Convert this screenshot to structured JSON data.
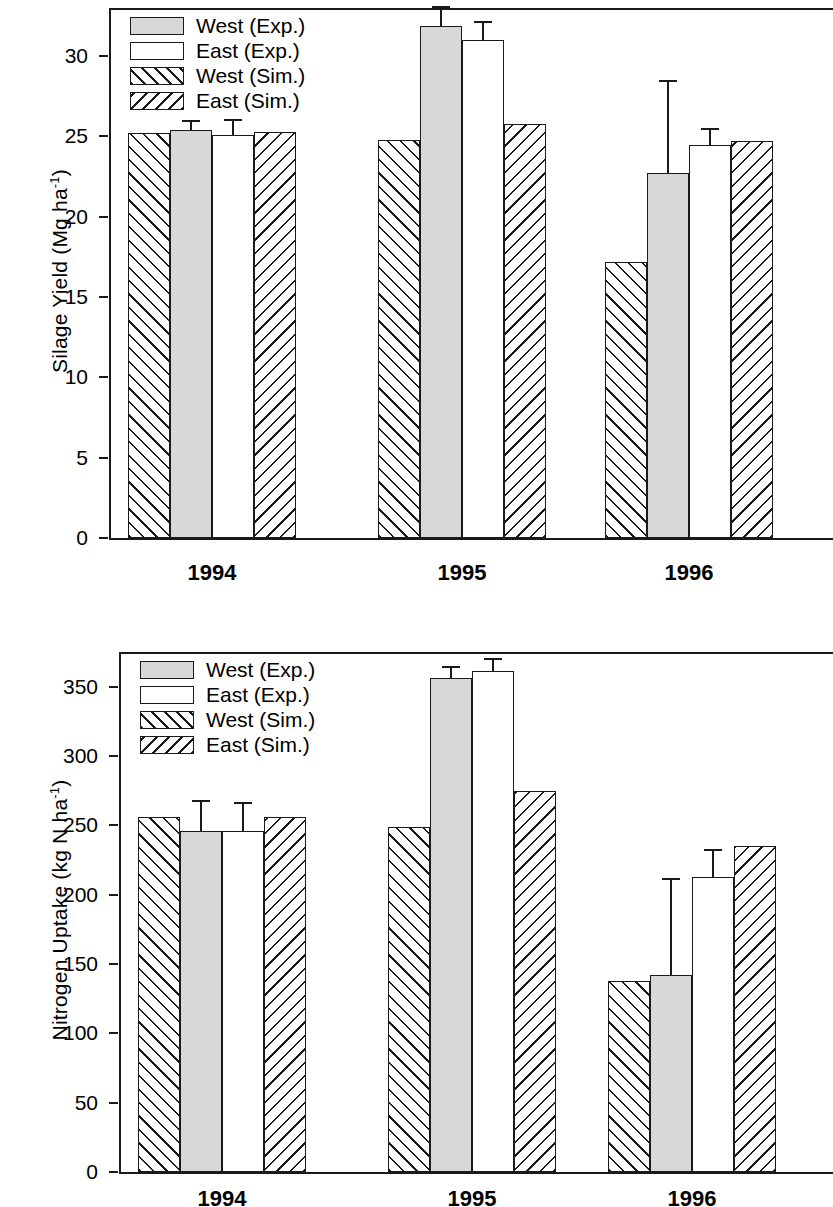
{
  "figure": {
    "legend_labels": [
      "West (Exp.)",
      "East (Exp.)",
      "West (Sim.)",
      "East (Sim.)"
    ],
    "series_keys": [
      "exp-west",
      "exp-east",
      "sim-west",
      "sim-east"
    ],
    "bar_order_in_group": [
      "West (Sim.)",
      "West (Exp.)",
      "East (Exp.)",
      "East (Sim.)"
    ],
    "colors": {
      "line": "#1a1a1a",
      "exp_west_fill": "#d8d8d8",
      "exp_east_fill": "#ffffff",
      "background": "#ffffff"
    }
  },
  "chart_data": [
    {
      "type": "bar",
      "title": "",
      "xlabel": "",
      "ylabel": "Silage Yield (Mg ha-1)",
      "ylabel_parts": {
        "text": "Silage Yield (Mg ha",
        "sup": "-1",
        "tail": ")"
      },
      "categories": [
        "1994",
        "1995",
        "1996"
      ],
      "yticks": [
        0,
        5,
        10,
        15,
        20,
        25,
        30
      ],
      "ylim": [
        0,
        33
      ],
      "grid": false,
      "legend_position": "top-left inside",
      "series": [
        {
          "name": "West (Sim.)",
          "values": [
            25.2,
            24.8,
            17.2
          ],
          "errors": [
            null,
            null,
            null
          ]
        },
        {
          "name": "West (Exp.)",
          "values": [
            25.4,
            31.9,
            22.7
          ],
          "errors": [
            0.6,
            1.2,
            5.8
          ]
        },
        {
          "name": "East (Exp.)",
          "values": [
            25.1,
            31.0,
            24.5
          ],
          "errors": [
            1.0,
            1.2,
            1.0
          ]
        },
        {
          "name": "East (Sim.)",
          "values": [
            25.3,
            25.8,
            24.7
          ],
          "errors": [
            null,
            null,
            null
          ]
        }
      ]
    },
    {
      "type": "bar",
      "title": "",
      "xlabel": "",
      "ylabel": "Nitrogen Uptake (kg N ha-1)",
      "ylabel_parts": {
        "text": "Nitrogen Uptake (kg N ha",
        "sup": "-1",
        "tail": ")"
      },
      "categories": [
        "1994",
        "1995",
        "1996"
      ],
      "yticks": [
        0,
        50,
        100,
        150,
        200,
        250,
        300,
        350
      ],
      "ylim": [
        0,
        375
      ],
      "grid": false,
      "legend_position": "top-left inside",
      "series": [
        {
          "name": "West (Sim.)",
          "values": [
            256,
            249,
            138
          ],
          "errors": [
            null,
            null,
            null
          ]
        },
        {
          "name": "West (Exp.)",
          "values": [
            246,
            356,
            142
          ],
          "errors": [
            22,
            9,
            70
          ]
        },
        {
          "name": "East (Exp.)",
          "values": [
            246,
            361,
            213
          ],
          "errors": [
            21,
            10,
            20
          ]
        },
        {
          "name": "East (Sim.)",
          "values": [
            256,
            275,
            235
          ],
          "errors": [
            null,
            null,
            null
          ]
        }
      ]
    }
  ]
}
